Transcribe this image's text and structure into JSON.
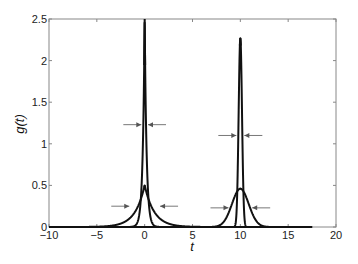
{
  "chart_data": {
    "type": "line",
    "title": "",
    "xlabel": "t",
    "ylabel": "g(t)",
    "xlim": [
      -10,
      20
    ],
    "ylim": [
      0,
      2.5
    ],
    "grid": false,
    "legend": null,
    "x_ticks": [
      -10,
      -5,
      0,
      5,
      10,
      15,
      20
    ],
    "x_tick_labels": [
      "−10",
      "−5",
      "0",
      "5",
      "10",
      "15",
      "20"
    ],
    "y_ticks": [
      0,
      0.5,
      1,
      1.5,
      2,
      2.5
    ],
    "y_tick_labels": [
      "0",
      "0.5",
      "1",
      "1.5",
      "2",
      "2.5"
    ],
    "series": [
      {
        "name": "narrow-exponential-t0",
        "shape": "double-exponential",
        "center": 0,
        "peak": 2.5,
        "decay_rate": 5
      },
      {
        "name": "broad-exponential-t0",
        "shape": "double-exponential",
        "center": 0,
        "peak": 0.5,
        "decay_rate": 1
      },
      {
        "name": "narrow-gaussian-t10",
        "shape": "gaussian",
        "center": 10,
        "peak": 2.27,
        "sigma": 0.176
      },
      {
        "name": "broad-gaussian-t10",
        "shape": "gaussian",
        "center": 10,
        "peak": 0.46,
        "sigma": 0.87
      }
    ],
    "x_range_plotted": [
      -10,
      17.5
    ],
    "annotations": [
      {
        "type": "fwhm-arrows",
        "center": 0,
        "y": 1.23,
        "note": "half max of narrow t=0 peak"
      },
      {
        "type": "fwhm-arrows",
        "center": 0,
        "y": 0.25,
        "note": "half max of broad t=0 peak"
      },
      {
        "type": "fwhm-arrows",
        "center": 10,
        "y": 1.1,
        "note": "half max of narrow t=10 peak"
      },
      {
        "type": "fwhm-arrows",
        "center": 10,
        "y": 0.23,
        "note": "half max of broad t=10 peak"
      }
    ]
  },
  "colors": {
    "curve": "#111111",
    "axes": "#888888",
    "arrow": "#555555"
  }
}
